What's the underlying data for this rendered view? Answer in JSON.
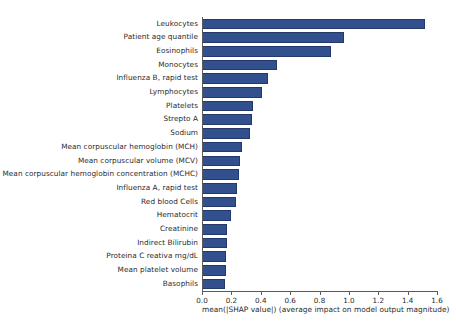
{
  "chart_data": {
    "type": "bar",
    "orientation": "horizontal",
    "title": "",
    "xlabel": "mean(|SHAP value|) (average impact on model output magnitude)",
    "ylabel": "",
    "xlim": [
      0.0,
      1.6
    ],
    "ylim": [
      0,
      20
    ],
    "grid": false,
    "legend": null,
    "bar_color": "#32508e",
    "xticks": [
      "0.0",
      "0.2",
      "0.4",
      "0.6",
      "0.8",
      "1.0",
      "1.2",
      "1.4",
      "1.6"
    ],
    "xtick_values": [
      0.0,
      0.2,
      0.4,
      0.6,
      0.8,
      1.0,
      1.2,
      1.4,
      1.6
    ],
    "categories": [
      "Leukocytes",
      "Patient age quantile",
      "Eosinophils",
      "Monocytes",
      "Influenza B, rapid test",
      "Lymphocytes",
      "Platelets",
      "Strepto A",
      "Sodium",
      "Mean corpuscular hemoglobin (MCH)",
      "Mean corpuscular volume (MCV)",
      "Mean corpuscular hemoglobin concentration (MCHC)",
      "Influenza A, rapid test",
      "Red blood Cells",
      "Hematocrit",
      "Creatinine",
      "Indirect Bilirubin",
      "Proteina C reativa mg/dL",
      "Mean platelet volume",
      "Basophils"
    ],
    "values": [
      1.52,
      0.97,
      0.88,
      0.51,
      0.45,
      0.41,
      0.35,
      0.34,
      0.33,
      0.27,
      0.26,
      0.25,
      0.24,
      0.23,
      0.2,
      0.17,
      0.17,
      0.165,
      0.16,
      0.155
    ]
  }
}
